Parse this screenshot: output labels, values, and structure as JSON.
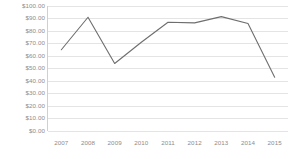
{
  "chart_data": {
    "type": "line",
    "title": "",
    "subtitle": "",
    "xlabel": "",
    "ylabel": "",
    "categories": [
      "2007",
      "2008",
      "2009",
      "2010",
      "2011",
      "2012",
      "2013",
      "2014",
      "2015"
    ],
    "values": [
      65.0,
      91.0,
      54.0,
      71.0,
      87.0,
      86.5,
      91.5,
      86.0,
      43.0
    ],
    "series": [
      {
        "name": "",
        "values": [
          65.0,
          91.0,
          54.0,
          71.0,
          87.0,
          86.5,
          91.5,
          86.0,
          43.0
        ]
      }
    ],
    "ylim": [
      0,
      100
    ],
    "y_tick_step": 10,
    "y_tick_values": [
      0,
      10,
      20,
      30,
      40,
      50,
      60,
      70,
      80,
      90,
      100
    ],
    "y_tick_labels": [
      "$100.00",
      "$90.00",
      "$80.00",
      "$70.00",
      "$60.00",
      "$50.00",
      "$40.00",
      "$30.00",
      "$20.00",
      "$10.00",
      "$0.00"
    ],
    "x_tick_labels": [
      "2007",
      "2008",
      "2009",
      "2010",
      "2011",
      "2012",
      "2013",
      "2014",
      "2015"
    ],
    "value_prefix": "$",
    "grid": true,
    "grid_axis": "y",
    "legend": false,
    "legend_position": "none",
    "markers": false,
    "annotations": []
  },
  "style": {
    "line_color": "#6e6e6e",
    "grid_color": "#e4e4e4",
    "axis_color": "#d0d0d0",
    "tick_text_color": "#8c8c8c",
    "background": "#ffffff"
  }
}
